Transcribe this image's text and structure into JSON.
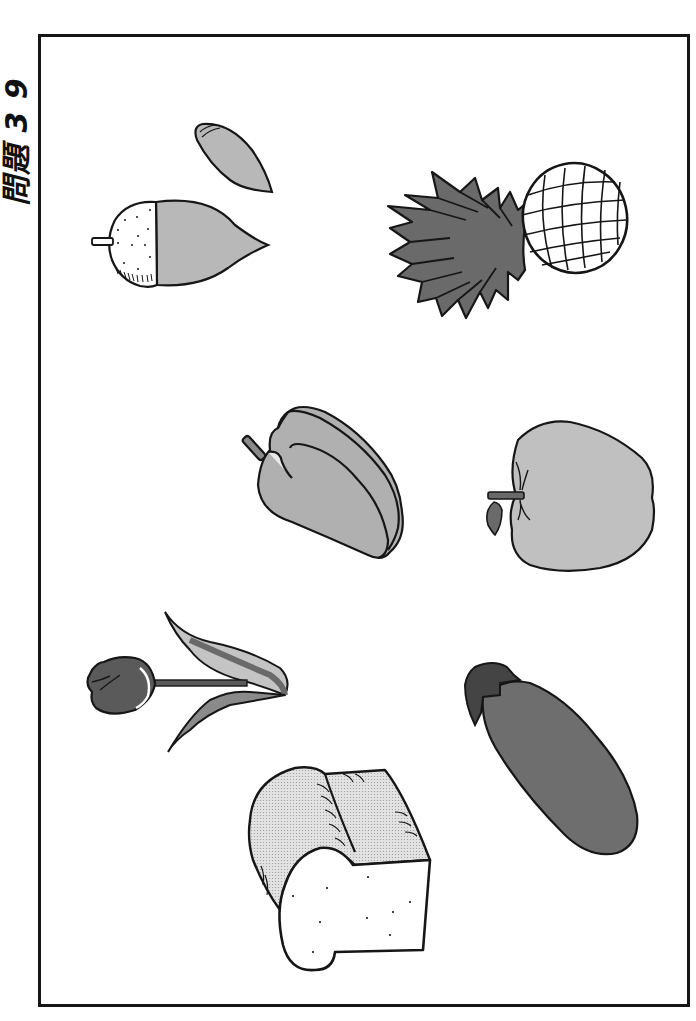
{
  "page": {
    "title_display": "問題 3 9",
    "orientation": "rotated-90"
  },
  "illustrations": [
    {
      "id": "acorn",
      "label": "acorn",
      "position": "top-left"
    },
    {
      "id": "pineapple",
      "label": "pineapple",
      "position": "top-right"
    },
    {
      "id": "bell-pepper",
      "label": "bell pepper",
      "position": "middle-left"
    },
    {
      "id": "apple",
      "label": "apple",
      "position": "middle-right"
    },
    {
      "id": "tulip",
      "label": "tulip",
      "position": "lower-left"
    },
    {
      "id": "eggplant",
      "label": "eggplant",
      "position": "lower-right"
    },
    {
      "id": "bread",
      "label": "bread loaf",
      "position": "bottom-center"
    }
  ],
  "colors": {
    "outline": "#161616",
    "light_gray": "#b8b8b8",
    "mid_gray": "#9c9c9c",
    "dark_gray": "#6a6a6a",
    "darker_gray": "#555555",
    "bread_crust": "#d9d9d9",
    "background": "#ffffff"
  }
}
